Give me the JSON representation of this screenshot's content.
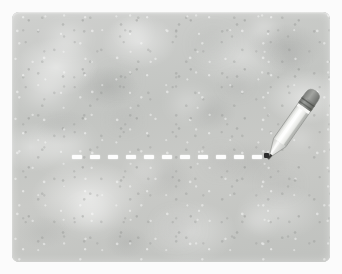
{
  "scene": {
    "title": "Pencil drawing a dashed line on a gray slate board",
    "width": 342,
    "height": 274,
    "page_background_color": "#fbfbfb"
  },
  "board": {
    "name": "gray slate board",
    "description": "Mottled light-gray concrete / slate rectangle with rounded corners",
    "base_color": "#c6c7c5",
    "highlight_color": "#dcdedb",
    "shadow_color": "#a9aba9",
    "x": 12,
    "y": 12,
    "width": 318,
    "height": 250,
    "corner_radius": 7
  },
  "dashed_line": {
    "name": "dashed chalk line",
    "color": "#fdfdfd",
    "y": 155,
    "start_x": 72,
    "end_x": 266,
    "thickness": 4,
    "dash_length": 10,
    "gap_length": 8,
    "dash_count": 11,
    "dashes": [
      {
        "x": 72,
        "w": 10
      },
      {
        "x": 90,
        "w": 10
      },
      {
        "x": 108,
        "w": 10
      },
      {
        "x": 126,
        "w": 10
      },
      {
        "x": 144,
        "w": 10
      },
      {
        "x": 162,
        "w": 10
      },
      {
        "x": 180,
        "w": 10
      },
      {
        "x": 198,
        "w": 10
      },
      {
        "x": 216,
        "w": 10
      },
      {
        "x": 234,
        "w": 10
      },
      {
        "x": 252,
        "w": 10
      }
    ]
  },
  "pencil": {
    "name": "pencil",
    "description": "Short stubby pencil tilted, tip resting at the right end of the dashed line",
    "rotation_degrees": 35,
    "body_color": "#f2f2f0",
    "body_shadow_color": "#bcbdba",
    "body_highlight_color": "#ffffff",
    "ferrule_color": "#8d8f8c",
    "ferrule_dark_color": "#6f716e",
    "eraser_color": "#9b9d9a",
    "tip_wood_color": "#e6e6e3",
    "graphite_color": "#2d2d2d",
    "tip_x": 266,
    "tip_y": 155,
    "length": 66
  },
  "blotches": [
    {
      "left": 38,
      "top": 16,
      "w": 34,
      "h": 22,
      "color": "rgba(255,255,255,0.40)",
      "blur": 9
    },
    {
      "left": 108,
      "top": 10,
      "w": 26,
      "h": 18,
      "color": "rgba(255,255,255,0.34)",
      "blur": 8
    },
    {
      "left": 186,
      "top": 22,
      "w": 30,
      "h": 20,
      "color": "rgba(166,168,166,0.22)",
      "blur": 9
    },
    {
      "left": 240,
      "top": 8,
      "w": 24,
      "h": 16,
      "color": "rgba(255,255,255,0.36)",
      "blur": 7
    },
    {
      "left": 268,
      "top": 40,
      "w": 20,
      "h": 14,
      "color": "rgba(162,164,162,0.26)",
      "blur": 7
    },
    {
      "left": 14,
      "top": 66,
      "w": 40,
      "h": 26,
      "color": "rgba(255,255,255,0.38)",
      "blur": 10
    },
    {
      "left": 92,
      "top": 58,
      "w": 28,
      "h": 18,
      "color": "rgba(166,168,166,0.20)",
      "blur": 8
    },
    {
      "left": 160,
      "top": 80,
      "w": 34,
      "h": 22,
      "color": "rgba(255,255,255,0.30)",
      "blur": 9
    },
    {
      "left": 214,
      "top": 64,
      "w": 22,
      "h": 16,
      "color": "rgba(164,166,164,0.22)",
      "blur": 7
    },
    {
      "left": 30,
      "top": 120,
      "w": 44,
      "h": 28,
      "color": "rgba(255,255,255,0.44)",
      "blur": 11
    },
    {
      "left": 120,
      "top": 150,
      "w": 30,
      "h": 20,
      "color": "rgba(255,255,255,0.32)",
      "blur": 9
    },
    {
      "left": 196,
      "top": 140,
      "w": 26,
      "h": 18,
      "color": "rgba(162,164,162,0.22)",
      "blur": 8
    },
    {
      "left": 254,
      "top": 162,
      "w": 30,
      "h": 20,
      "color": "rgba(166,168,166,0.18)",
      "blur": 8
    },
    {
      "left": 60,
      "top": 190,
      "w": 38,
      "h": 24,
      "color": "rgba(255,255,255,0.40)",
      "blur": 10
    },
    {
      "left": 150,
      "top": 206,
      "w": 32,
      "h": 20,
      "color": "rgba(164,166,164,0.20)",
      "blur": 9
    },
    {
      "left": 232,
      "top": 200,
      "w": 28,
      "h": 18,
      "color": "rgba(255,255,255,0.30)",
      "blur": 8
    },
    {
      "left": 100,
      "top": 100,
      "w": 24,
      "h": 16,
      "color": "rgba(164,166,164,0.18)",
      "blur": 7
    },
    {
      "left": 276,
      "top": 118,
      "w": 22,
      "h": 16,
      "color": "rgba(255,255,255,0.26)",
      "blur": 7
    }
  ]
}
